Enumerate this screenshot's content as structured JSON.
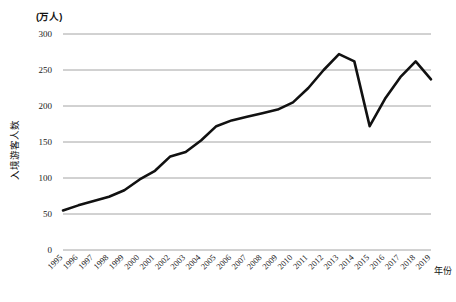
{
  "chart_data": {
    "type": "line",
    "title": "",
    "xlabel": "年份",
    "ylabel": "入境游客人数",
    "unit_label": "(万人)",
    "ylim": [
      0,
      300
    ],
    "yticks": [
      0,
      50,
      100,
      150,
      200,
      250,
      300
    ],
    "ytick_labels": [
      "0",
      "50",
      "100",
      "150",
      "200",
      "250",
      "300"
    ],
    "grid": "horizontal",
    "legend": "none",
    "line_color": "#111111",
    "grid_color": "#9a9a9a",
    "categories": [
      "1995",
      "1996",
      "1997",
      "1998",
      "1999",
      "2000",
      "2001",
      "2002",
      "2003",
      "2004",
      "2005",
      "2006",
      "2007",
      "2008",
      "2009",
      "2010",
      "2011",
      "2012",
      "2013",
      "2014",
      "2015",
      "2016",
      "2017",
      "2018",
      "2019"
    ],
    "series": [
      {
        "name": "入境游客人数",
        "values": [
          55,
          62,
          68,
          74,
          83,
          98,
          110,
          130,
          136,
          152,
          172,
          180,
          185,
          190,
          195,
          205,
          225,
          250,
          272,
          262,
          172,
          210,
          240,
          262,
          237
        ]
      }
    ]
  },
  "axes": {
    "y_unit": "(万人)",
    "y_title": "入境游客人数",
    "x_title": "年份"
  }
}
